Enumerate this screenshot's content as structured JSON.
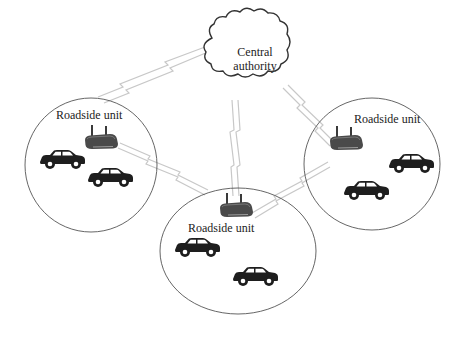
{
  "diagram": {
    "type": "network-topology",
    "central_node": {
      "label_line1": "Central",
      "label_line2": "authority",
      "shape": "cloud"
    },
    "zones": [
      {
        "id": "left",
        "label": "Roadside unit",
        "device_icon": "router-icon",
        "vehicles": 2
      },
      {
        "id": "middle",
        "label": "Roadside unit",
        "device_icon": "router-icon",
        "vehicles": 2
      },
      {
        "id": "right",
        "label": "Roadside unit",
        "device_icon": "router-icon",
        "vehicles": 2
      }
    ],
    "links": [
      {
        "from": "Central authority",
        "to": "left",
        "style": "wireless"
      },
      {
        "from": "Central authority",
        "to": "middle",
        "style": "wireless"
      },
      {
        "from": "Central authority",
        "to": "right",
        "style": "wireless"
      },
      {
        "from": "left",
        "to": "middle",
        "style": "wireless"
      },
      {
        "from": "right",
        "to": "middle",
        "style": "wireless"
      }
    ],
    "colors": {
      "outline": "#555555",
      "link": "#c8c8c8",
      "vehicle": "#1e1e1e",
      "router": "#4a4a4a"
    }
  }
}
